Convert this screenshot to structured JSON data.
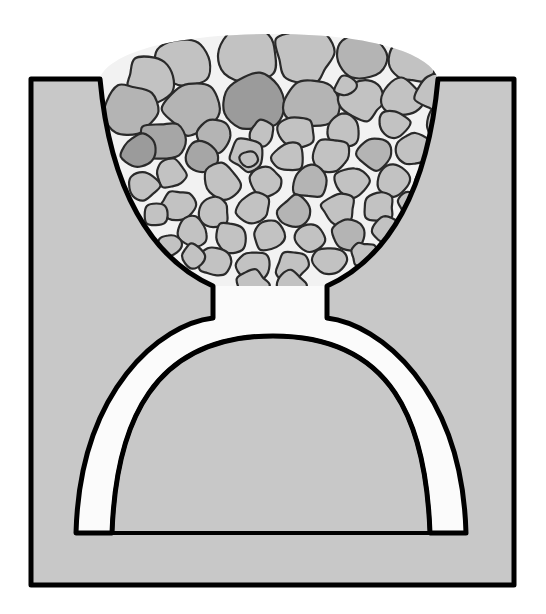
{
  "figure": {
    "width": 546,
    "height": 614,
    "background_color": "#ffffff"
  },
  "colors": {
    "page_background": "#ffffff",
    "vessel_fill": "#c8c8c8",
    "outline": "#000000",
    "void_fill": "#fbfbfb",
    "interstitial_fill": "#f2f2f2",
    "particle_light": "#c2c2c2",
    "particle_mid": "#b4b4b4",
    "particle_dark": "#a6a6a6",
    "particle_darker": "#9b9b9b",
    "particle_outline": "#2a2a2a"
  },
  "geometry": {
    "vessel": {
      "left": 31,
      "top": 79,
      "right": 514,
      "bottom": 585,
      "stroke_width": 5
    },
    "hopper": {
      "left_lip_x": 100,
      "right_lip_x": 438,
      "lip_y": 79,
      "neck_left_x": 213,
      "neck_right_x": 327,
      "neck_top_y": 286,
      "neck_bottom_y": 318
    },
    "arch": {
      "outer_apex_y": 315,
      "inner_apex_y": 336,
      "band_thickness": 34,
      "leg_bottom_y": 533,
      "left_leg_outer_x": 76,
      "left_leg_inner_x": 112,
      "right_leg_inner_x": 430,
      "right_leg_outer_x": 466
    },
    "heap": {
      "apex_y": 34,
      "left_x": 112,
      "right_x": 430
    }
  },
  "labels": {
    "vessel": "hopper-body",
    "bed": "granular-bed",
    "void": "void-beneath-arch",
    "arch": "stable-arch-band",
    "outlet": "outlet-neck"
  },
  "chart_data": {
    "type": "diagram",
    "particle_count": 96,
    "particle_size_range_px": [
      9,
      56
    ],
    "notes": [
      "Vessel walls shown as a uniform mid-grey solid with a heavy black outline.",
      "The granular bed heaps above the vessel rim.",
      "The arch band and the void under it are rendered white."
    ]
  },
  "particles": [
    {
      "cx": 183,
      "cy": 62,
      "r": 30,
      "n": 9,
      "seed": 3,
      "tone": "particle_light"
    },
    {
      "cx": 246,
      "cy": 53,
      "r": 32,
      "n": 8,
      "seed": 11,
      "tone": "particle_light"
    },
    {
      "cx": 306,
      "cy": 52,
      "r": 31,
      "n": 9,
      "seed": 19,
      "tone": "particle_light"
    },
    {
      "cx": 362,
      "cy": 56,
      "r": 27,
      "n": 8,
      "seed": 27,
      "tone": "particle_mid"
    },
    {
      "cx": 150,
      "cy": 80,
      "r": 25,
      "n": 9,
      "seed": 35,
      "tone": "particle_light"
    },
    {
      "cx": 412,
      "cy": 62,
      "r": 24,
      "n": 8,
      "seed": 43,
      "tone": "particle_light"
    },
    {
      "cx": 131,
      "cy": 110,
      "r": 28,
      "n": 9,
      "seed": 51,
      "tone": "particle_mid"
    },
    {
      "cx": 191,
      "cy": 107,
      "r": 29,
      "n": 8,
      "seed": 59,
      "tone": "particle_mid"
    },
    {
      "cx": 254,
      "cy": 104,
      "r": 30,
      "n": 9,
      "seed": 67,
      "tone": "particle_darker"
    },
    {
      "cx": 312,
      "cy": 101,
      "r": 27,
      "n": 8,
      "seed": 75,
      "tone": "particle_mid"
    },
    {
      "cx": 362,
      "cy": 100,
      "r": 21,
      "n": 9,
      "seed": 83,
      "tone": "particle_light"
    },
    {
      "cx": 403,
      "cy": 98,
      "r": 20,
      "n": 8,
      "seed": 91,
      "tone": "particle_light"
    },
    {
      "cx": 437,
      "cy": 92,
      "r": 21,
      "n": 9,
      "seed": 99,
      "tone": "particle_light"
    },
    {
      "cx": 345,
      "cy": 87,
      "r": 11,
      "n": 7,
      "seed": 107,
      "tone": "particle_light"
    },
    {
      "cx": 393,
      "cy": 124,
      "r": 16,
      "n": 8,
      "seed": 115,
      "tone": "particle_light"
    },
    {
      "cx": 444,
      "cy": 124,
      "r": 20,
      "n": 9,
      "seed": 123,
      "tone": "particle_light"
    },
    {
      "cx": 161,
      "cy": 141,
      "r": 22,
      "n": 8,
      "seed": 131,
      "tone": "particle_dark"
    },
    {
      "cx": 215,
      "cy": 136,
      "r": 19,
      "n": 9,
      "seed": 139,
      "tone": "particle_mid"
    },
    {
      "cx": 262,
      "cy": 133,
      "r": 13,
      "n": 8,
      "seed": 147,
      "tone": "particle_light"
    },
    {
      "cx": 297,
      "cy": 132,
      "r": 19,
      "n": 9,
      "seed": 155,
      "tone": "particle_light"
    },
    {
      "cx": 344,
      "cy": 130,
      "r": 17,
      "n": 8,
      "seed": 163,
      "tone": "particle_light"
    },
    {
      "cx": 139,
      "cy": 152,
      "r": 19,
      "n": 9,
      "seed": 171,
      "tone": "particle_darker"
    },
    {
      "cx": 203,
      "cy": 157,
      "r": 17,
      "n": 8,
      "seed": 179,
      "tone": "particle_dark"
    },
    {
      "cx": 247,
      "cy": 155,
      "r": 17,
      "n": 9,
      "seed": 187,
      "tone": "particle_light"
    },
    {
      "cx": 288,
      "cy": 157,
      "r": 16,
      "n": 8,
      "seed": 195,
      "tone": "particle_light"
    },
    {
      "cx": 332,
      "cy": 155,
      "r": 18,
      "n": 9,
      "seed": 203,
      "tone": "particle_light"
    },
    {
      "cx": 375,
      "cy": 153,
      "r": 17,
      "n": 8,
      "seed": 211,
      "tone": "particle_mid"
    },
    {
      "cx": 414,
      "cy": 150,
      "r": 16,
      "n": 9,
      "seed": 219,
      "tone": "particle_light"
    },
    {
      "cx": 446,
      "cy": 155,
      "r": 18,
      "n": 8,
      "seed": 227,
      "tone": "particle_light"
    },
    {
      "cx": 171,
      "cy": 174,
      "r": 16,
      "n": 9,
      "seed": 235,
      "tone": "particle_light"
    },
    {
      "cx": 222,
      "cy": 183,
      "r": 19,
      "n": 8,
      "seed": 243,
      "tone": "particle_light"
    },
    {
      "cx": 265,
      "cy": 181,
      "r": 16,
      "n": 9,
      "seed": 251,
      "tone": "particle_light"
    },
    {
      "cx": 309,
      "cy": 182,
      "r": 17,
      "n": 8,
      "seed": 259,
      "tone": "particle_mid"
    },
    {
      "cx": 352,
      "cy": 182,
      "r": 17,
      "n": 9,
      "seed": 267,
      "tone": "particle_light"
    },
    {
      "cx": 393,
      "cy": 180,
      "r": 16,
      "n": 8,
      "seed": 275,
      "tone": "particle_light"
    },
    {
      "cx": 430,
      "cy": 180,
      "r": 16,
      "n": 9,
      "seed": 283,
      "tone": "particle_light"
    },
    {
      "cx": 144,
      "cy": 186,
      "r": 15,
      "n": 8,
      "seed": 291,
      "tone": "particle_light"
    },
    {
      "cx": 248,
      "cy": 160,
      "r": 9,
      "n": 7,
      "seed": 299,
      "tone": "particle_light"
    },
    {
      "cx": 177,
      "cy": 205,
      "r": 17,
      "n": 9,
      "seed": 307,
      "tone": "particle_light"
    },
    {
      "cx": 215,
      "cy": 212,
      "r": 15,
      "n": 8,
      "seed": 315,
      "tone": "particle_light"
    },
    {
      "cx": 254,
      "cy": 209,
      "r": 17,
      "n": 9,
      "seed": 323,
      "tone": "particle_light"
    },
    {
      "cx": 296,
      "cy": 211,
      "r": 17,
      "n": 8,
      "seed": 331,
      "tone": "particle_mid"
    },
    {
      "cx": 338,
      "cy": 209,
      "r": 17,
      "n": 9,
      "seed": 339,
      "tone": "particle_light"
    },
    {
      "cx": 378,
      "cy": 207,
      "r": 16,
      "n": 8,
      "seed": 347,
      "tone": "particle_light"
    },
    {
      "cx": 414,
      "cy": 206,
      "r": 15,
      "n": 9,
      "seed": 355,
      "tone": "particle_light"
    },
    {
      "cx": 156,
      "cy": 215,
      "r": 13,
      "n": 8,
      "seed": 363,
      "tone": "particle_light"
    },
    {
      "cx": 192,
      "cy": 233,
      "r": 16,
      "n": 9,
      "seed": 371,
      "tone": "particle_light"
    },
    {
      "cx": 231,
      "cy": 237,
      "r": 16,
      "n": 8,
      "seed": 379,
      "tone": "particle_light"
    },
    {
      "cx": 270,
      "cy": 236,
      "r": 16,
      "n": 9,
      "seed": 387,
      "tone": "particle_light"
    },
    {
      "cx": 310,
      "cy": 237,
      "r": 16,
      "n": 8,
      "seed": 395,
      "tone": "particle_light"
    },
    {
      "cx": 349,
      "cy": 234,
      "r": 16,
      "n": 9,
      "seed": 403,
      "tone": "particle_mid"
    },
    {
      "cx": 386,
      "cy": 231,
      "r": 14,
      "n": 8,
      "seed": 411,
      "tone": "particle_light"
    },
    {
      "cx": 170,
      "cy": 245,
      "r": 12,
      "n": 7,
      "seed": 419,
      "tone": "particle_light"
    },
    {
      "cx": 215,
      "cy": 263,
      "r": 16,
      "n": 9,
      "seed": 427,
      "tone": "particle_light"
    },
    {
      "cx": 253,
      "cy": 266,
      "r": 16,
      "n": 8,
      "seed": 435,
      "tone": "particle_light"
    },
    {
      "cx": 292,
      "cy": 266,
      "r": 16,
      "n": 9,
      "seed": 443,
      "tone": "particle_light"
    },
    {
      "cx": 330,
      "cy": 261,
      "r": 16,
      "n": 8,
      "seed": 451,
      "tone": "particle_light"
    },
    {
      "cx": 363,
      "cy": 254,
      "r": 13,
      "n": 9,
      "seed": 459,
      "tone": "particle_light"
    },
    {
      "cx": 192,
      "cy": 256,
      "r": 12,
      "n": 8,
      "seed": 467,
      "tone": "particle_light"
    },
    {
      "cx": 252,
      "cy": 285,
      "r": 16,
      "n": 9,
      "seed": 475,
      "tone": "particle_light"
    },
    {
      "cx": 290,
      "cy": 285,
      "r": 15,
      "n": 8,
      "seed": 483,
      "tone": "particle_light"
    }
  ]
}
